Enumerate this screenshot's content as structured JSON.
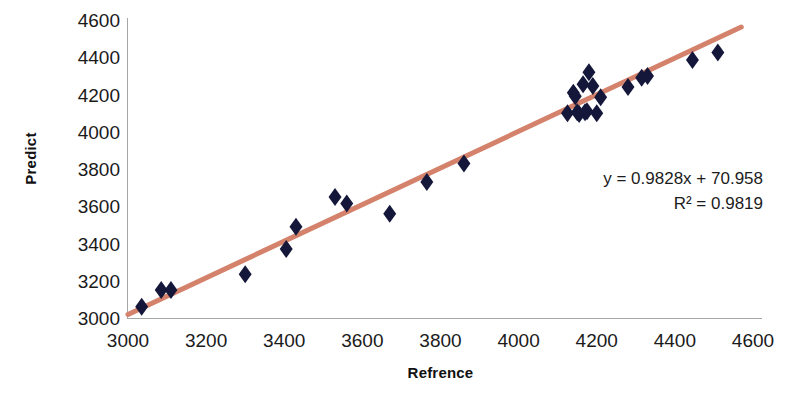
{
  "chart_data": {
    "type": "scatter",
    "title": "",
    "xlabel": "Refrence",
    "ylabel": "Predict",
    "xlim": [
      3000,
      4600
    ],
    "ylim": [
      3000,
      4600
    ],
    "xticks": [
      3000,
      3200,
      3400,
      3600,
      3800,
      4000,
      4200,
      4400,
      4600
    ],
    "yticks": [
      3000,
      3200,
      3400,
      3600,
      3800,
      4000,
      4200,
      4400,
      4600
    ],
    "grid": false,
    "legend": false,
    "marker": {
      "shape": "diamond",
      "color": "#14173a",
      "size": 9
    },
    "trendline": {
      "color": "#d4826b",
      "width": 5,
      "slope": 0.9828,
      "intercept": 70.958,
      "x_start": 3000,
      "x_end": 4570
    },
    "annotations": {
      "equation": "y = 0.9828x + 70.958",
      "r_squared": "R² = 0.9819"
    },
    "points": [
      {
        "x": 3035,
        "y": 3060
      },
      {
        "x": 3085,
        "y": 3150
      },
      {
        "x": 3110,
        "y": 3150
      },
      {
        "x": 3300,
        "y": 3235
      },
      {
        "x": 3405,
        "y": 3370
      },
      {
        "x": 3430,
        "y": 3490
      },
      {
        "x": 3530,
        "y": 3650
      },
      {
        "x": 3560,
        "y": 3615
      },
      {
        "x": 3670,
        "y": 3560
      },
      {
        "x": 3765,
        "y": 3730
      },
      {
        "x": 3860,
        "y": 3830
      },
      {
        "x": 4125,
        "y": 4100
      },
      {
        "x": 4140,
        "y": 4210
      },
      {
        "x": 4145,
        "y": 4190
      },
      {
        "x": 4150,
        "y": 4105
      },
      {
        "x": 4155,
        "y": 4095
      },
      {
        "x": 4165,
        "y": 4255
      },
      {
        "x": 4170,
        "y": 4105
      },
      {
        "x": 4175,
        "y": 4110
      },
      {
        "x": 4180,
        "y": 4320
      },
      {
        "x": 4190,
        "y": 4245
      },
      {
        "x": 4200,
        "y": 4100
      },
      {
        "x": 4210,
        "y": 4185
      },
      {
        "x": 4280,
        "y": 4240
      },
      {
        "x": 4315,
        "y": 4290
      },
      {
        "x": 4330,
        "y": 4300
      },
      {
        "x": 4445,
        "y": 4385
      },
      {
        "x": 4510,
        "y": 4425
      }
    ]
  }
}
